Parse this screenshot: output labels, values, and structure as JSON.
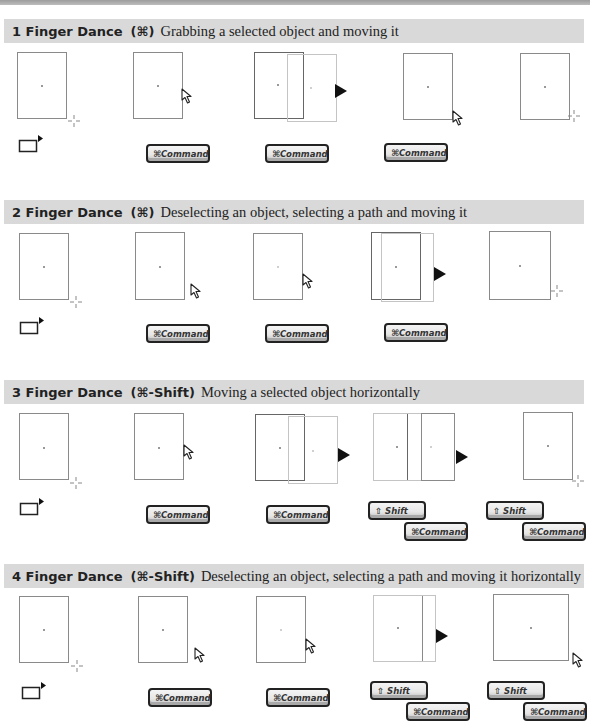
{
  "page": {
    "accent_header_bg": "#d9d9d9",
    "stroke_color": "#8a8a8a"
  },
  "keys": {
    "command_label": "⌘Command",
    "shift_label": "⇧ Shift"
  },
  "icons": {
    "select_tool": "rectangle-with-arrow-icon",
    "hollow_arrow": "arrow-cursor-icon",
    "solid_arrow": "move-cursor-icon",
    "crosshair": "crosshair-cursor-icon"
  },
  "sections": [
    {
      "number": "1",
      "title": "1 Finger Dance",
      "modifier": "(⌘)",
      "description": "Grabbing a selected object and moving it",
      "steps": [
        {
          "state": "selected object, crosshair",
          "keys": []
        },
        {
          "state": "hollow arrow at edge",
          "keys": [
            "command"
          ]
        },
        {
          "state": "object dragged with solid arrow",
          "keys": [
            "command"
          ]
        },
        {
          "state": "hollow arrow at corner",
          "keys": [
            "command"
          ]
        },
        {
          "state": "moved object, crosshair",
          "keys": []
        }
      ]
    },
    {
      "number": "2",
      "title": "2 Finger Dance",
      "modifier": "(⌘)",
      "description": "Deselecting an object, selecting a path and moving it",
      "steps": [
        {
          "state": "selected object, crosshair",
          "keys": []
        },
        {
          "state": "hollow arrow",
          "keys": [
            "command"
          ]
        },
        {
          "state": "path selected with hollow arrow",
          "keys": [
            "command"
          ]
        },
        {
          "state": "path dragged with solid arrow",
          "keys": [
            "command"
          ]
        },
        {
          "state": "moved path, crosshair",
          "keys": []
        }
      ]
    },
    {
      "number": "3",
      "title": "3 Finger Dance",
      "modifier": "(⌘-Shift)",
      "description": "Moving a selected object horizontally",
      "steps": [
        {
          "state": "selected object, crosshair",
          "keys": []
        },
        {
          "state": "hollow arrow at edge",
          "keys": [
            "command"
          ]
        },
        {
          "state": "object dragged",
          "keys": [
            "command"
          ]
        },
        {
          "state": "object dragged horizontally",
          "keys": [
            "shift",
            "command"
          ]
        },
        {
          "state": "moved object, crosshair",
          "keys": [
            "shift",
            "command"
          ]
        }
      ]
    },
    {
      "number": "4",
      "title": "4 Finger Dance",
      "modifier": "(⌘-Shift)",
      "description": "Deselecting an object, selecting a path and moving it horizontally",
      "steps": [
        {
          "state": "selected object, crosshair",
          "keys": []
        },
        {
          "state": "hollow arrow",
          "keys": [
            "command"
          ]
        },
        {
          "state": "path selected with hollow arrow",
          "keys": [
            "command"
          ]
        },
        {
          "state": "path dragged horizontally",
          "keys": [
            "shift",
            "command"
          ]
        },
        {
          "state": "moved path, hollow arrow",
          "keys": [
            "shift",
            "command"
          ]
        }
      ]
    }
  ]
}
